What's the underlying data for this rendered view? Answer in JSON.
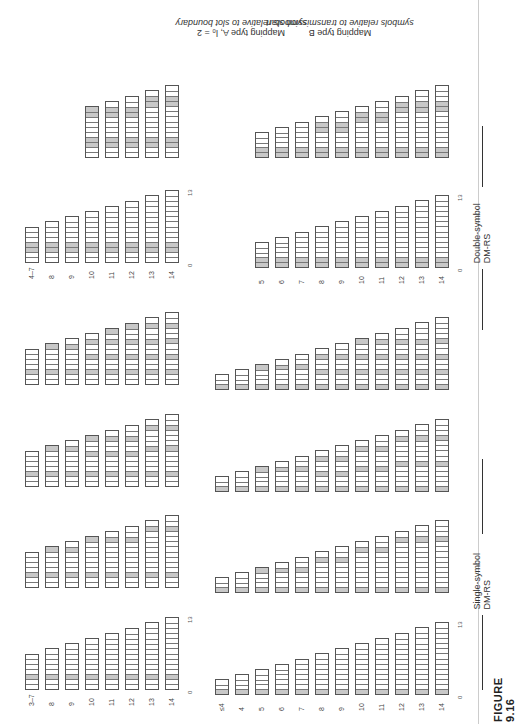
{
  "figure": {
    "label": "FIGURE 9.16"
  },
  "sections": {
    "single": "Single-symbol DM-RS",
    "double": "Double-symbol DM-RS"
  },
  "titles": {
    "typeA_line1": "Mapping type A, l₀ = 2",
    "typeA_line2": "symbols relative to slot boundary",
    "typeB_line1": "Mapping type B",
    "typeB_line2": "symbols relative to transmission start"
  },
  "axis": {
    "start": "0",
    "end": "13"
  },
  "colors": {
    "dmrs": "#c8c8c8",
    "data": "#ffffff",
    "border": "#555555"
  },
  "chart_data": {
    "type": "table",
    "typeA": {
      "labels": [
        "3–7",
        "8",
        "9",
        "10",
        "11",
        "12",
        "13",
        "14"
      ],
      "lengths": [
        7,
        8,
        9,
        10,
        11,
        12,
        13,
        14
      ],
      "single": [
        [
          [
            2
          ],
          [
            2
          ],
          [
            2
          ],
          [
            2
          ],
          [
            2
          ],
          [
            2
          ],
          [
            2
          ],
          [
            2
          ]
        ],
        [
          [
            2
          ],
          [
            2,
            7
          ],
          [
            2,
            7
          ],
          [
            2,
            9
          ],
          [
            2,
            9
          ],
          [
            2,
            9
          ],
          [
            2,
            11
          ],
          [
            2,
            11
          ]
        ],
        [
          [
            2
          ],
          [
            2,
            7
          ],
          [
            2,
            7
          ],
          [
            2,
            6,
            9
          ],
          [
            2,
            6,
            9
          ],
          [
            2,
            6,
            9
          ],
          [
            2,
            7,
            11
          ],
          [
            2,
            7,
            11
          ]
        ],
        [
          [
            2
          ],
          [
            2,
            7
          ],
          [
            2,
            7
          ],
          [
            2,
            5,
            8
          ],
          [
            2,
            5,
            8,
            10
          ],
          [
            2,
            5,
            8,
            11
          ],
          [
            2,
            5,
            8,
            11
          ],
          [
            2,
            5,
            8,
            11
          ]
        ]
      ],
      "double_labels": [
        "4–7",
        "8",
        "9",
        "10",
        "11",
        "12",
        "13",
        "14"
      ],
      "double": [
        [
          [
            2,
            3
          ],
          [
            2,
            3
          ],
          [
            2,
            3
          ],
          [
            2,
            3
          ],
          [
            2,
            3
          ],
          [
            2,
            3
          ],
          [
            2,
            3
          ],
          [
            2,
            3
          ]
        ],
        [
          [
            2,
            3
          ],
          [
            2,
            3
          ],
          [
            2,
            3
          ],
          [
            2,
            3,
            8,
            9
          ],
          [
            2,
            3,
            8,
            9
          ],
          [
            2,
            3,
            8,
            9
          ],
          [
            2,
            3,
            10,
            11
          ],
          [
            2,
            3,
            10,
            11
          ]
        ]
      ]
    },
    "typeB": {
      "labels": [
        "≤4",
        "4",
        "5",
        "6",
        "7",
        "8",
        "9",
        "10",
        "11",
        "12",
        "13",
        "14"
      ],
      "lengths": [
        3,
        4,
        5,
        6,
        7,
        8,
        9,
        10,
        11,
        12,
        13,
        14
      ],
      "single": [
        [
          [
            0
          ],
          [
            0
          ],
          [
            0
          ],
          [
            0
          ],
          [
            0
          ],
          [
            0
          ],
          [
            0
          ],
          [
            0
          ],
          [
            0
          ],
          [
            0
          ],
          [
            0
          ],
          [
            0
          ]
        ],
        [
          [
            0
          ],
          [
            0
          ],
          [
            0,
            4
          ],
          [
            0,
            4
          ],
          [
            0,
            4
          ],
          [
            0,
            6
          ],
          [
            0,
            6
          ],
          [
            0,
            8
          ],
          [
            0,
            8
          ],
          [
            0,
            10
          ],
          [
            0,
            10
          ],
          [
            0,
            10
          ]
        ],
        [
          [
            0
          ],
          [
            0
          ],
          [
            0,
            4
          ],
          [
            0,
            4
          ],
          [
            0,
            4
          ],
          [
            0,
            3,
            6
          ],
          [
            0,
            3,
            6
          ],
          [
            0,
            4,
            8
          ],
          [
            0,
            4,
            8
          ],
          [
            0,
            5,
            10
          ],
          [
            0,
            5,
            10
          ],
          [
            0,
            5,
            10
          ]
        ],
        [
          [
            0
          ],
          [
            0
          ],
          [
            0,
            4
          ],
          [
            0,
            4
          ],
          [
            0,
            4
          ],
          [
            0,
            3,
            6
          ],
          [
            0,
            3,
            6
          ],
          [
            0,
            3,
            6,
            9
          ],
          [
            0,
            3,
            6,
            9
          ],
          [
            0,
            3,
            6,
            9
          ],
          [
            0,
            3,
            6,
            9
          ],
          [
            0,
            3,
            6,
            9
          ]
        ]
      ],
      "double_labels": [
        "5",
        "6",
        "7",
        "8",
        "9",
        "10",
        "11",
        "12",
        "13",
        "14"
      ],
      "double": [
        [
          [
            0,
            1
          ],
          [
            0,
            1
          ],
          [
            0,
            1
          ],
          [
            0,
            1
          ],
          [
            0,
            1
          ],
          [
            0,
            1
          ],
          [
            0,
            1
          ],
          [
            0,
            1
          ],
          [
            0,
            1
          ],
          [
            0,
            1
          ]
        ],
        [
          [
            0,
            1
          ],
          [
            0,
            1
          ],
          [
            0,
            1
          ],
          [
            0,
            1,
            5,
            6
          ],
          [
            0,
            1,
            5,
            6
          ],
          [
            0,
            1,
            7,
            8
          ],
          [
            0,
            1,
            7,
            8
          ],
          [
            0,
            1,
            9,
            10
          ],
          [
            0,
            1,
            9,
            10
          ],
          [
            0,
            1,
            9,
            10
          ]
        ]
      ]
    }
  }
}
